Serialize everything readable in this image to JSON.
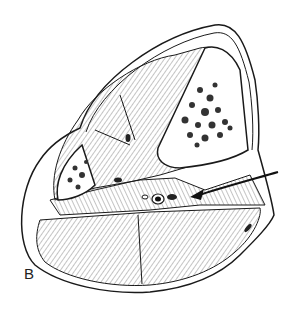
{
  "figure": {
    "panel_label": "B",
    "structures": [
      "tibia",
      "fibula",
      "muscle compartments",
      "neurovascular bundle",
      "skin and subcutaneous layer"
    ],
    "annotation": {
      "type": "arrow",
      "pointing_to": "neurovascular bundle"
    },
    "colors": {
      "line": "#1a1a1a",
      "background": "#ffffff",
      "bone": "#ffffff"
    }
  }
}
